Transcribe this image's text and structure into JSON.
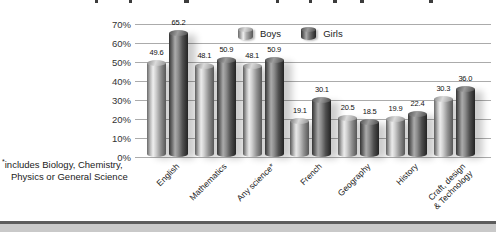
{
  "chart_data": {
    "type": "bar",
    "style": "3d-cylinder-grayscale",
    "categories": [
      "English",
      "Mathematics",
      "Any science*",
      "French",
      "Geography",
      "History",
      "Craft, design\n& Technology"
    ],
    "series": [
      {
        "name": "Boys",
        "values": [
          49.6,
          48.1,
          48.1,
          19.1,
          20.5,
          19.9,
          30.3
        ]
      },
      {
        "name": "Girls",
        "values": [
          65.2,
          50.9,
          50.9,
          30.1,
          18.5,
          22.4,
          36.0
        ]
      }
    ],
    "value_labels_shown": true,
    "ylim": [
      0,
      70
    ],
    "y_ticks": [
      "70%",
      "60%",
      "50%",
      "40%",
      "30%",
      "20%",
      "10%",
      "0%"
    ],
    "grid": true,
    "legend_position": "top-center",
    "footnote": {
      "marker": "*",
      "line1": "includes Biology, Chemistry,",
      "line2": "Physics or General Science"
    },
    "colors": {
      "boys_highlight": "#efefef",
      "boys_edge": "#565656",
      "girls_highlight": "#ababab",
      "girls_edge": "#232323",
      "gridline": "#ababab",
      "text": "#222222",
      "bottom_rule": "#5c5c5c",
      "bottom_band": "#c9c9c9"
    }
  }
}
